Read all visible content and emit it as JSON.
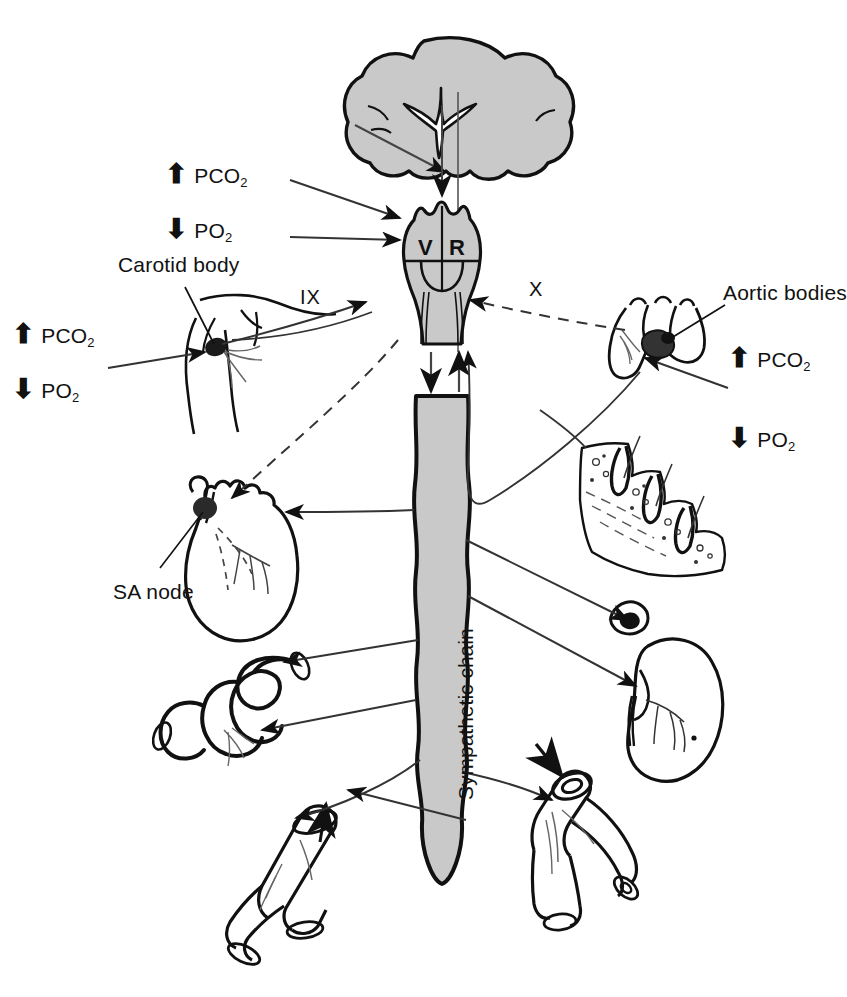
{
  "figure": {
    "type": "anatomical-schematic",
    "background_color": "#ffffff",
    "line_color": "#111111",
    "fill_gray": "#c9c9c9"
  },
  "labels": {
    "carotid_body": "Carotid body",
    "aortic_bodies": "Aortic bodies",
    "sa_node": "SA node",
    "sympathetic_chain": "Sympathetic chain",
    "nerve_ix": "IX",
    "nerve_x": "X",
    "center_v": "V",
    "center_r": "R"
  },
  "gas_markers": [
    {
      "id": "upper-left-pco2",
      "arrow": "up",
      "text": "PCO",
      "sub": "2",
      "x": 200,
      "y": 163
    },
    {
      "id": "upper-left-po2",
      "arrow": "down",
      "text": "PO",
      "sub": "2",
      "x": 200,
      "y": 219
    },
    {
      "id": "lower-left-pco2",
      "arrow": "up",
      "text": "PCO",
      "sub": "2",
      "x": 30,
      "y": 323
    },
    {
      "id": "lower-left-po2",
      "arrow": "down",
      "text": "PO",
      "sub": "2",
      "x": 30,
      "y": 378
    },
    {
      "id": "right-pco2",
      "arrow": "up",
      "text": "PCO",
      "sub": "2",
      "x": 740,
      "y": 347
    },
    {
      "id": "right-po2",
      "arrow": "down",
      "text": "PO",
      "sub": "2",
      "x": 740,
      "y": 427
    }
  ],
  "organs": [
    {
      "id": "brain",
      "name": "cerebrum-coronal-section"
    },
    {
      "id": "medulla",
      "name": "medulla-oblongata-with-vasomotor-and-respiratory-centers"
    },
    {
      "id": "spinal-cord",
      "name": "spinal-cord-sympathetic-chain"
    },
    {
      "id": "carotid-bifurcation",
      "name": "carotid-artery-bifurcation-with-carotid-body"
    },
    {
      "id": "aortic-arch",
      "name": "aortic-arch-with-aortic-bodies"
    },
    {
      "id": "heart",
      "name": "heart-with-sa-node"
    },
    {
      "id": "skin",
      "name": "skin-with-sweat-glands"
    },
    {
      "id": "kidney",
      "name": "kidney-with-adrenal-gland"
    },
    {
      "id": "intestine",
      "name": "intestine-segment"
    },
    {
      "id": "vessel-dilated",
      "name": "blood-vessel-vasodilation"
    },
    {
      "id": "vessel-constricted",
      "name": "blood-vessel-vasoconstriction"
    }
  ]
}
